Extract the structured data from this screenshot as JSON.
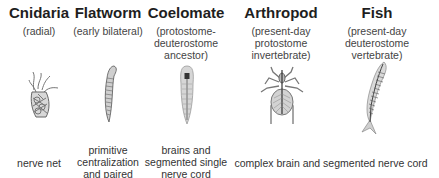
{
  "columns": [
    {
      "id": "cnidaria",
      "title": "Cnidaria",
      "subtitle": [
        "(radial)"
      ],
      "illustration": "cnidaria-icon",
      "center_x": 39
    },
    {
      "id": "flatworm",
      "title": "Flatworm",
      "subtitle": [
        "(early bilateral)"
      ],
      "illustration": "flatworm-icon",
      "center_x": 108
    },
    {
      "id": "coelomate",
      "title": "Coelomate",
      "subtitle": [
        "(protostome-",
        "deuterostome",
        "ancestor)"
      ],
      "illustration": "coelomate-icon",
      "center_x": 186
    },
    {
      "id": "arthropod",
      "title": "Arthropod",
      "subtitle": [
        "(present-day",
        "protostome",
        "invertebrate)"
      ],
      "illustration": "arthropod-icon",
      "center_x": 281
    },
    {
      "id": "fish",
      "title": "Fish",
      "subtitle": [
        "(present-day",
        "deuterostome",
        "vertebrate)"
      ],
      "illustration": "fish-icon",
      "center_x": 377
    }
  ],
  "bottom_labels": [
    {
      "id": "cnidaria",
      "lines": [
        "nerve net"
      ]
    },
    {
      "id": "flatworm",
      "lines": [
        "primitive",
        "centralization",
        "and paired"
      ]
    },
    {
      "id": "coelomate",
      "lines": [
        "brains and",
        "segmented single",
        "nerve cord"
      ]
    },
    {
      "id": "arthropod-fish",
      "lines": [
        "complex brain and segmented nerve cord"
      ]
    }
  ],
  "colors": {
    "text": "#222222",
    "illustration": "#6a6a6a",
    "background": "#ffffff"
  }
}
